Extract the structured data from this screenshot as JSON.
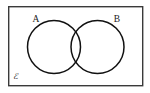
{
  "figure": {
    "background_color": "#ffffff",
    "line_color": "#111111",
    "border_color": "#3a3a3a"
  },
  "universal_set": {
    "label": "ℰ",
    "label_name": "universal-set-symbol",
    "shape": "rectangle",
    "x": 8,
    "y": 6,
    "width": 135,
    "height": 80
  },
  "sets": [
    {
      "label": "A",
      "shape": "circle",
      "cx": 54,
      "cy": 47,
      "r": 26.5
    },
    {
      "label": "B",
      "shape": "circle",
      "cx": 97.5,
      "cy": 47,
      "r": 26.5
    }
  ],
  "labels": [
    {
      "text": "A",
      "x": 36,
      "y": 22
    },
    {
      "text": "B",
      "x": 116,
      "y": 22
    },
    {
      "text": "ℰ",
      "x": 13,
      "y": 78
    }
  ]
}
